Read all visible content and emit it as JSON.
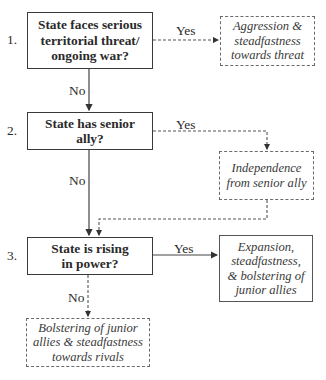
{
  "steps": [
    {
      "number": "1.",
      "question": "State faces serious territorial threat/ ongoing war?",
      "question_lines": [
        "State faces serious",
        "territorial threat/",
        "ongoing war?"
      ],
      "yes_label": "Yes",
      "no_label": "No",
      "yes_outcome_lines": [
        "Aggression &",
        "steadfastness",
        "towards threat"
      ]
    },
    {
      "number": "2.",
      "question": "State has senior ally?",
      "question_lines": [
        "State has senior",
        "ally?"
      ],
      "yes_label": "Yes",
      "no_label": "No",
      "yes_outcome_lines": [
        "Independence",
        "from senior ally"
      ]
    },
    {
      "number": "3.",
      "question": "State is rising in power?",
      "question_lines": [
        "State is rising",
        "in power?"
      ],
      "yes_label": "Yes",
      "no_label": "No",
      "yes_outcome_lines": [
        "Expansion,",
        "steadfastness,",
        "& bolstering of",
        "junior allies"
      ],
      "no_outcome_lines": [
        "Bolstering of junior",
        "allies & steadfastness",
        "towards rivals"
      ]
    }
  ],
  "colors": {
    "line": "#3a3a3a",
    "dashed": "#6a6a6a",
    "background": "#ffffff"
  }
}
